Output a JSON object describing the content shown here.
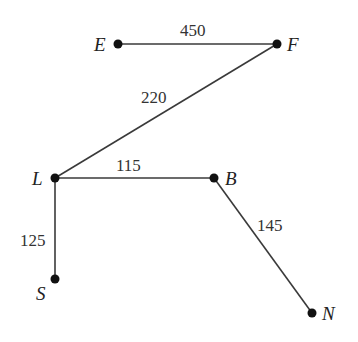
{
  "diagram": {
    "type": "weighted-graph",
    "nodes": [
      {
        "id": "E",
        "label": "E",
        "x": 118,
        "y": 44
      },
      {
        "id": "F",
        "label": "F",
        "x": 277,
        "y": 44
      },
      {
        "id": "L",
        "label": "L",
        "x": 55,
        "y": 178
      },
      {
        "id": "B",
        "label": "B",
        "x": 214,
        "y": 178
      },
      {
        "id": "S",
        "label": "S",
        "x": 55,
        "y": 279
      },
      {
        "id": "N",
        "label": "N",
        "x": 312,
        "y": 313
      }
    ],
    "edges": [
      {
        "from": "E",
        "to": "F",
        "weight": "450"
      },
      {
        "from": "F",
        "to": "L",
        "weight": "220"
      },
      {
        "from": "L",
        "to": "B",
        "weight": "115"
      },
      {
        "from": "L",
        "to": "S",
        "weight": "125"
      },
      {
        "from": "B",
        "to": "N",
        "weight": "145"
      }
    ]
  }
}
